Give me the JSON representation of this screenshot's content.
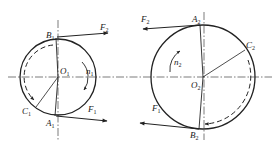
{
  "figure": {
    "colors": {
      "stroke": "#222222",
      "background": "#ffffff"
    },
    "left_pulley": {
      "center_label": "O",
      "center_sub": "1",
      "point_top": "B",
      "point_top_sub": "1",
      "point_bottom": "A",
      "point_bottom_sub": "1",
      "point_arc": "C",
      "point_arc_sub": "1",
      "tension_top": "F",
      "tension_top_sub": "2",
      "tension_bottom": "F",
      "tension_bottom_sub": "1",
      "speed": "n",
      "speed_sub": "1"
    },
    "right_pulley": {
      "center_label": "O",
      "center_sub": "2",
      "point_top": "A",
      "point_top_sub": "2",
      "point_bottom": "B",
      "point_bottom_sub": "2",
      "point_arc": "C",
      "point_arc_sub": "2",
      "tension_top": "F",
      "tension_top_sub": "2",
      "tension_bottom": "F",
      "tension_bottom_sub": "1",
      "speed": "n",
      "speed_sub": "2"
    }
  }
}
